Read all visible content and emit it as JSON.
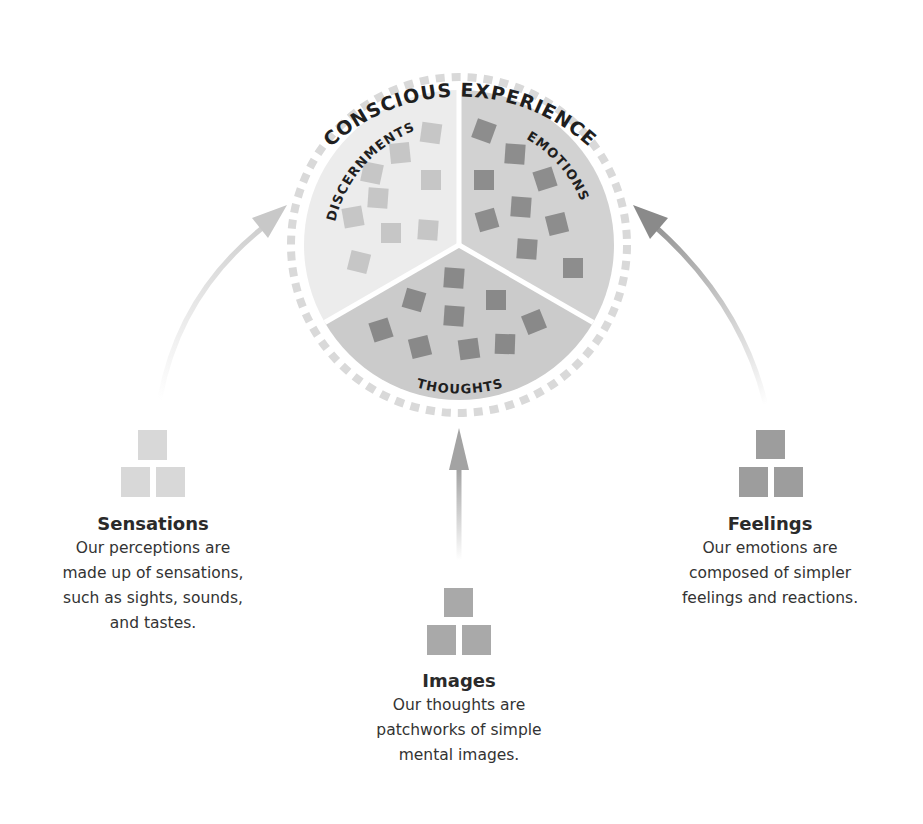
{
  "diagram": {
    "title": "CONSCIOUS EXPERIENCE",
    "colors": {
      "background": "#ffffff",
      "ring_dash": "#d9d9d9",
      "separator": "#ffffff",
      "discernments_bg": "#ececec",
      "discernments_square": "#c6c6c6",
      "emotions_bg": "#d2d2d2",
      "emotions_square": "#8d8d8d",
      "thoughts_bg": "#cbcbcb",
      "thoughts_square": "#898989",
      "label_text": "#1f1f1f",
      "arrow_left": "#c8c8c8",
      "arrow_middle": "#a3a3a3",
      "arrow_right": "#8c8c8c"
    },
    "circle": {
      "cx": 459,
      "cy": 245,
      "pie_radius": 155,
      "ring_radius": 168
    },
    "sectors": [
      {
        "id": "discernments",
        "label": "DISCERNMENTS",
        "squares": [
          [
            431,
            133,
            8
          ],
          [
            400,
            153,
            -6
          ],
          [
            372,
            173,
            12
          ],
          [
            431,
            180,
            0
          ],
          [
            378,
            198,
            4
          ],
          [
            353,
            217,
            -10
          ],
          [
            391,
            233,
            0
          ],
          [
            428,
            230,
            4
          ],
          [
            359,
            262,
            14
          ]
        ]
      },
      {
        "id": "emotions",
        "label": "EMOTIONS",
        "squares": [
          [
            484,
            131,
            20
          ],
          [
            515,
            154,
            4
          ],
          [
            484,
            180,
            0
          ],
          [
            545,
            179,
            -18
          ],
          [
            521,
            207,
            4
          ],
          [
            487,
            220,
            -16
          ],
          [
            557,
            224,
            -14
          ],
          [
            527,
            249,
            4
          ],
          [
            573,
            268,
            0
          ]
        ]
      },
      {
        "id": "thoughts",
        "label": "THOUGHTS",
        "squares": [
          [
            454,
            278,
            4
          ],
          [
            414,
            300,
            16
          ],
          [
            496,
            300,
            0
          ],
          [
            454,
            316,
            4
          ],
          [
            534,
            322,
            -22
          ],
          [
            381,
            330,
            -18
          ],
          [
            420,
            347,
            -14
          ],
          [
            469,
            349,
            -8
          ],
          [
            505,
            344,
            2
          ]
        ]
      }
    ]
  },
  "sources": [
    {
      "id": "sensations",
      "title": "Sensations",
      "body": "Our perceptions are\nmade up of sensations,\nsuch as sights, sounds,\nand tastes.",
      "icon": "stacked-squares-icon",
      "icon_color": "#d8d8d8"
    },
    {
      "id": "images",
      "title": "Images",
      "body": "Our thoughts are\npatchworks of simple\nmental images.",
      "icon": "stacked-squares-icon",
      "icon_color": "#a9a9a9"
    },
    {
      "id": "feelings",
      "title": "Feelings",
      "body": "Our emotions are\ncomposed of simpler\nfeelings and reactions.",
      "icon": "stacked-squares-icon",
      "icon_color": "#9d9d9d"
    }
  ]
}
